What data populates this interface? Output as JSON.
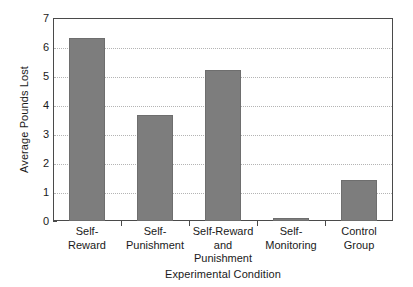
{
  "chart_data": {
    "type": "bar",
    "title": "",
    "xlabel": "Experimental Condition",
    "ylabel": "Average Pounds Lost",
    "categories": [
      "Self-Reward",
      "Self-Punishment",
      "Self-Reward and Punishment",
      "Self-Monitoring",
      "Control Group"
    ],
    "category_lines": [
      [
        "Self-",
        "Reward"
      ],
      [
        "Self-",
        "Punishment"
      ],
      [
        "Self-Reward",
        "and",
        "Punishment"
      ],
      [
        "Self-",
        "Monitoring"
      ],
      [
        "Control",
        "Group"
      ]
    ],
    "values": [
      6.3,
      3.65,
      5.2,
      0.1,
      1.4
    ],
    "ylim": [
      0,
      7
    ],
    "yticks": [
      0,
      1,
      2,
      3,
      4,
      5,
      6,
      7
    ],
    "ytick_labels": [
      "0",
      "1",
      "2",
      "3",
      "4",
      "5",
      "6",
      "7"
    ],
    "grid": true,
    "grid_axis": "y",
    "grid_style": "dotted",
    "legend": false,
    "bar_color": "#7d7d7d",
    "bar_edge_color": "#6e6e6e",
    "axis_color": "#4a4a4a",
    "grid_color": "#b4b4b4",
    "background_color": "#ffffff"
  }
}
